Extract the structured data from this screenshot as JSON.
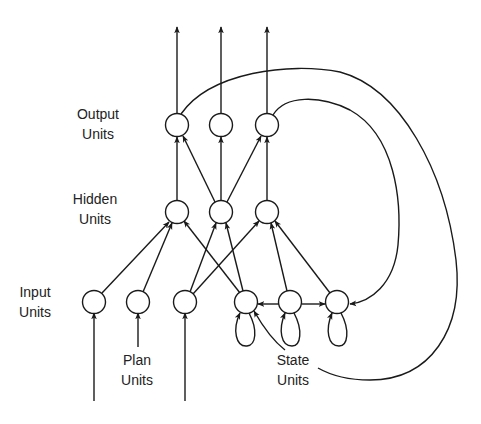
{
  "diagram": {
    "type": "jordan-recurrent-network",
    "colors": {
      "stroke": "#1a1a1a",
      "background": "#ffffff"
    },
    "labels": {
      "output": {
        "line1": "Output",
        "line2": "Units"
      },
      "hidden": {
        "line1": "Hidden",
        "line2": "Units"
      },
      "input": {
        "line1": "Input",
        "line2": "Units"
      },
      "plan": {
        "line1": "Plan",
        "line2": "Units"
      },
      "state": {
        "line1": "State",
        "line2": "Units"
      }
    },
    "layers": {
      "output": [
        "O1",
        "O2",
        "O3"
      ],
      "hidden": [
        "H1",
        "H2",
        "H3"
      ],
      "input": [
        "I1",
        "I2",
        "I3"
      ],
      "state": [
        "S1",
        "S2",
        "S3"
      ]
    },
    "edges": [
      [
        "H1",
        "O1"
      ],
      [
        "H2",
        "O1"
      ],
      [
        "H2",
        "O2"
      ],
      [
        "H2",
        "O3"
      ],
      [
        "H3",
        "O3"
      ],
      [
        "I1",
        "H1"
      ],
      [
        "I2",
        "H1"
      ],
      [
        "I3",
        "H2"
      ],
      [
        "I3",
        "H3"
      ],
      [
        "S1",
        "H1"
      ],
      [
        "S1",
        "H2"
      ],
      [
        "S2",
        "H3"
      ],
      [
        "S3",
        "H3"
      ],
      [
        "S2",
        "S1"
      ],
      [
        "S2",
        "S3"
      ],
      [
        "O1",
        "S1"
      ],
      [
        "O3",
        "S3"
      ],
      [
        "S1",
        "S1"
      ],
      [
        "S2",
        "S2"
      ],
      [
        "S3",
        "S3"
      ]
    ]
  }
}
